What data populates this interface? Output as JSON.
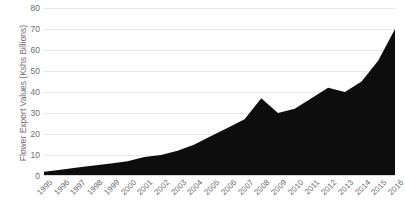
{
  "chart_data": {
    "type": "area",
    "title": "",
    "xlabel": "",
    "ylabel": "Flower Export Values (Kshs Billions)",
    "ylim": [
      0,
      80
    ],
    "yticks": [
      0,
      10,
      20,
      30,
      40,
      50,
      60,
      70,
      80
    ],
    "grid": true,
    "legend": "none",
    "series_color": "#0d0d0d",
    "categories": [
      "1995",
      "1996",
      "1997",
      "1998",
      "1999",
      "2000",
      "2001",
      "2002",
      "2003",
      "2004",
      "2005",
      "2006",
      "2007",
      "2008",
      "2009",
      "2010",
      "2011",
      "2012",
      "2013",
      "2014",
      "2015",
      "2016"
    ],
    "values": [
      2,
      3,
      4,
      5,
      6,
      7,
      9,
      10,
      12,
      15,
      19,
      23,
      27,
      37,
      30,
      32,
      37,
      42,
      40,
      45,
      55,
      70
    ],
    "series": [
      {
        "name": "Flower Export Values",
        "values": [
          2,
          3,
          4,
          5,
          6,
          7,
          9,
          10,
          12,
          15,
          19,
          23,
          27,
          37,
          30,
          32,
          37,
          42,
          40,
          45,
          55,
          70
        ]
      }
    ]
  }
}
